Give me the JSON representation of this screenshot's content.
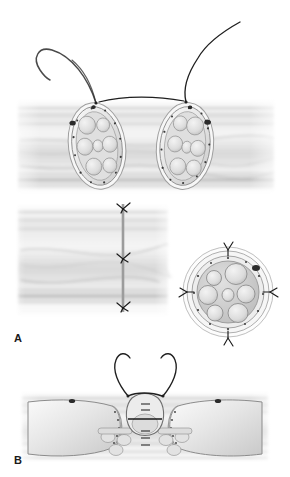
{
  "figure": {
    "kind": "medical-illustration",
    "background_color": "#ffffff",
    "width": 290,
    "height": 477
  },
  "panels": [
    {
      "id": "A",
      "label": "A",
      "label_position": {
        "x": 14,
        "y": 332
      },
      "caption_text": "A",
      "description": "epineurial repair: two transected nerve stumps approximated with suture; healed repair shown below with cross-section",
      "sub_scenes": [
        {
          "name": "approximation-scene",
          "description": "left and right nerve stumps with curved needles and suture bridging the gap",
          "nerve_stumps": [
            {
              "side": "left",
              "center": {
                "x": 97,
                "y": 146
              },
              "rx": 27,
              "ry": 42,
              "rotation_deg": -8,
              "fascicle_count": 7,
              "epineurium_vessel_dots": 14,
              "dark_vessel_marks": 2
            },
            {
              "side": "right",
              "center": {
                "x": 185,
                "y": 146
              },
              "rx": 27,
              "ry": 42,
              "rotation_deg": 6,
              "fascicle_count": 7,
              "epineurium_vessel_dots": 14,
              "dark_vessel_marks": 2
            }
          ],
          "needles": [
            {
              "name": "left-curved-needle",
              "entry": {
                "x": 96,
                "y": 103
              }
            },
            {
              "name": "right-suture-tail",
              "entry": {
                "x": 186,
                "y": 102
              }
            }
          ],
          "suture_bridge": {
            "from": {
              "x": 99,
              "y": 102
            },
            "to": {
              "x": 184,
              "y": 101
            }
          }
        },
        {
          "name": "coapted-scene",
          "description": "repaired nerve in longitudinal view with three epineurial suture knots along the coaptation line",
          "repair_line_x": 123,
          "knot_count": 3,
          "knots": [
            {
              "x": 123,
              "y": 208
            },
            {
              "x": 123,
              "y": 258
            },
            {
              "x": 123,
              "y": 307
            }
          ]
        },
        {
          "name": "cross-section-scene",
          "description": "transverse section of repaired nerve showing epineurium, seven fascicles and four circumferential sutures",
          "center": {
            "x": 228,
            "y": 292
          },
          "radius": 45,
          "fascicle_count": 7,
          "suture_count": 4,
          "suture_positions": [
            "top",
            "right",
            "bottom",
            "left"
          ],
          "dark_vessel_marks": 2
        }
      ]
    },
    {
      "id": "B",
      "label": "B",
      "label_position": {
        "x": 14,
        "y": 454
      },
      "caption_text": "B",
      "description": "perineurial / group fascicular repair: epineurium opened and reflected, individual fascicle group coapted with fine suture",
      "sub_scenes": [
        {
          "name": "opened-nerve-scene",
          "nerve_axis_y": 424,
          "left_segment": {
            "x": 30,
            "y": 390,
            "w": 100,
            "h": 70
          },
          "right_segment": {
            "x": 165,
            "y": 390,
            "w": 100,
            "h": 70
          },
          "central_fascicle_group": {
            "center": {
              "x": 145,
              "y": 412
            },
            "rx": 22,
            "ry": 24
          },
          "suture_count": 4,
          "needle_count": 2,
          "needle_arcs": [
            {
              "name": "left-curved-needle",
              "tip": {
                "x": 128,
                "y": 396
              }
            },
            {
              "name": "right-curved-needle",
              "tip": {
                "x": 163,
                "y": 396
              }
            }
          ],
          "epineurial_flap_dots": 22,
          "inner_fascicle_count": 6
        }
      ]
    }
  ],
  "palette": {
    "background": "#ffffff",
    "tissue_light": "#e8e8e8",
    "tissue_mid": "#cfcfcf",
    "tissue_dark": "#a8a8a8",
    "fascicle_fill": "#dcdcdc",
    "fascicle_stroke": "#9a9a9a",
    "epineurium_fill": "#f2f2f2",
    "epineurium_stroke": "#8c8c8c",
    "suture_color": "#1a1a1a",
    "vessel_dot": "#2b2b2b",
    "label_color": "#1a1a1a"
  }
}
